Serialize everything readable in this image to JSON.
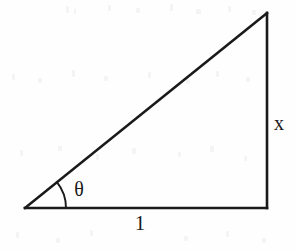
{
  "figure": {
    "kind": "right-triangle-diagram",
    "canvas": {
      "width": 295,
      "height": 251
    },
    "colors": {
      "stroke": "#1a1a1a",
      "background": "#fefefe",
      "label": "#1a1a1a"
    },
    "stroke_width": 2.6,
    "vertices": {
      "left": {
        "x": 25,
        "y": 208,
        "name": "angle-vertex"
      },
      "bottom_right": {
        "x": 267,
        "y": 208,
        "name": "right-angle-vertex"
      },
      "top_right": {
        "x": 267,
        "y": 13,
        "name": "apex-vertex"
      }
    },
    "sides": [
      {
        "name": "base",
        "from": "left",
        "to": "bottom_right",
        "label": "1"
      },
      {
        "name": "opposite",
        "from": "bottom_right",
        "to": "top_right",
        "label": "x"
      },
      {
        "name": "hypotenuse",
        "from": "left",
        "to": "top_right",
        "label": ""
      }
    ],
    "angle_arc": {
      "center": {
        "x": 25,
        "y": 208
      },
      "radius": 41,
      "start_deg": 0,
      "end_deg": 38.8,
      "label": "θ"
    },
    "labels": {
      "base": "1",
      "opposite": "x",
      "angle": "θ"
    }
  }
}
